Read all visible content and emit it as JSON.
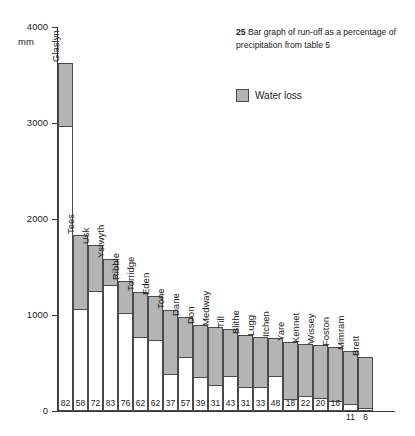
{
  "caption": {
    "number": "25",
    "text": " Bar graph of run-off as a percentage of precipitation from table 5"
  },
  "legend": {
    "label": "Water loss",
    "swatch_color": "#b4b4b4"
  },
  "axis": {
    "unit": "mm",
    "ticks": [
      "4000",
      "3000",
      "2000",
      "1000",
      "0"
    ]
  },
  "chart_data": {
    "type": "bar",
    "title": "25 Bar graph of run-off as a percentage of precipitation from table 5",
    "subtitle": "",
    "xlabel": "",
    "ylabel": "mm",
    "ylim": [
      0,
      4000
    ],
    "yticks": [
      0,
      1000,
      2000,
      3000,
      4000
    ],
    "grid": false,
    "legend_position": "top-right",
    "legend_entries": [
      "Water loss"
    ],
    "stacked": true,
    "note": "Each bar is total precipitation (mm), split into run-off (white, lower) and water loss (grey, upper). The number printed at the foot of each bar is run-off as a percentage of precipitation.",
    "categories": [
      "Glaslyn",
      "Tees",
      "Usk",
      "Ystwyth",
      "Ribble",
      "Torridge",
      "Eden",
      "Tone",
      "Dane",
      "Don",
      "Medway",
      "Till",
      "Blithe",
      "Lugg",
      "Itchen",
      "Yare",
      "Kennet",
      "Wissey",
      "Foston",
      "Mimram",
      "Brett"
    ],
    "runoff_percent": [
      82,
      58,
      72,
      83,
      76,
      62,
      62,
      37,
      57,
      39,
      31,
      43,
      31,
      33,
      48,
      18,
      22,
      20,
      16,
      11,
      6
    ],
    "precipitation_mm": [
      3620,
      1830,
      1730,
      1580,
      1350,
      1240,
      1200,
      1050,
      980,
      900,
      870,
      850,
      790,
      770,
      760,
      720,
      700,
      690,
      670,
      630,
      560
    ],
    "series": [
      {
        "name": "Run-off",
        "color": "#ffffff",
        "values": [
          2970,
          1060,
          1246,
          1311,
          1026,
          769,
          744,
          389,
          559,
          351,
          270,
          366,
          245,
          254,
          365,
          130,
          154,
          138,
          107,
          69,
          34
        ]
      },
      {
        "name": "Water loss",
        "color": "#b4b4b4",
        "values": [
          650,
          770,
          484,
          269,
          324,
          471,
          456,
          661,
          421,
          549,
          600,
          484,
          545,
          516,
          395,
          590,
          546,
          552,
          563,
          561,
          526
        ]
      }
    ]
  },
  "bars": [
    {
      "name": "Glaslyn",
      "value": "82",
      "total": 3620,
      "loss": 650,
      "value_below": false
    },
    {
      "name": "Tees",
      "value": "58",
      "total": 1830,
      "loss": 770,
      "value_below": false
    },
    {
      "name": "Usk",
      "value": "72",
      "total": 1730,
      "loss": 484,
      "value_below": false
    },
    {
      "name": "Ystwyth",
      "value": "83",
      "total": 1580,
      "loss": 269,
      "value_below": false
    },
    {
      "name": "Ribble",
      "value": "76",
      "total": 1350,
      "loss": 324,
      "value_below": false
    },
    {
      "name": "Torridge",
      "value": "62",
      "total": 1240,
      "loss": 471,
      "value_below": false
    },
    {
      "name": "Eden",
      "value": "62",
      "total": 1200,
      "loss": 456,
      "value_below": false
    },
    {
      "name": "Tone",
      "value": "37",
      "total": 1050,
      "loss": 661,
      "value_below": false
    },
    {
      "name": "Dane",
      "value": "57",
      "total": 980,
      "loss": 421,
      "value_below": false
    },
    {
      "name": "Don",
      "value": "39",
      "total": 900,
      "loss": 549,
      "value_below": false
    },
    {
      "name": "Medway",
      "value": "31",
      "total": 870,
      "loss": 600,
      "value_below": false
    },
    {
      "name": "Till",
      "value": "43",
      "total": 850,
      "loss": 484,
      "value_below": false
    },
    {
      "name": "Blithe",
      "value": "31",
      "total": 790,
      "loss": 545,
      "value_below": false
    },
    {
      "name": "Lugg",
      "value": "33",
      "total": 770,
      "loss": 516,
      "value_below": false
    },
    {
      "name": "Itchen",
      "value": "48",
      "total": 760,
      "loss": 395,
      "value_below": false
    },
    {
      "name": "Yare",
      "value": "18",
      "total": 720,
      "loss": 590,
      "value_below": false
    },
    {
      "name": "Kennet",
      "value": "22",
      "total": 700,
      "loss": 546,
      "value_below": false
    },
    {
      "name": "Wissey",
      "value": "20",
      "total": 690,
      "loss": 552,
      "value_below": false
    },
    {
      "name": "Foston",
      "value": "16",
      "total": 670,
      "loss": 563,
      "value_below": false
    },
    {
      "name": "Mimram",
      "value": "11",
      "total": 630,
      "loss": 561,
      "value_below": true
    },
    {
      "name": "Brett",
      "value": "6",
      "total": 560,
      "loss": 526,
      "value_below": true
    }
  ]
}
